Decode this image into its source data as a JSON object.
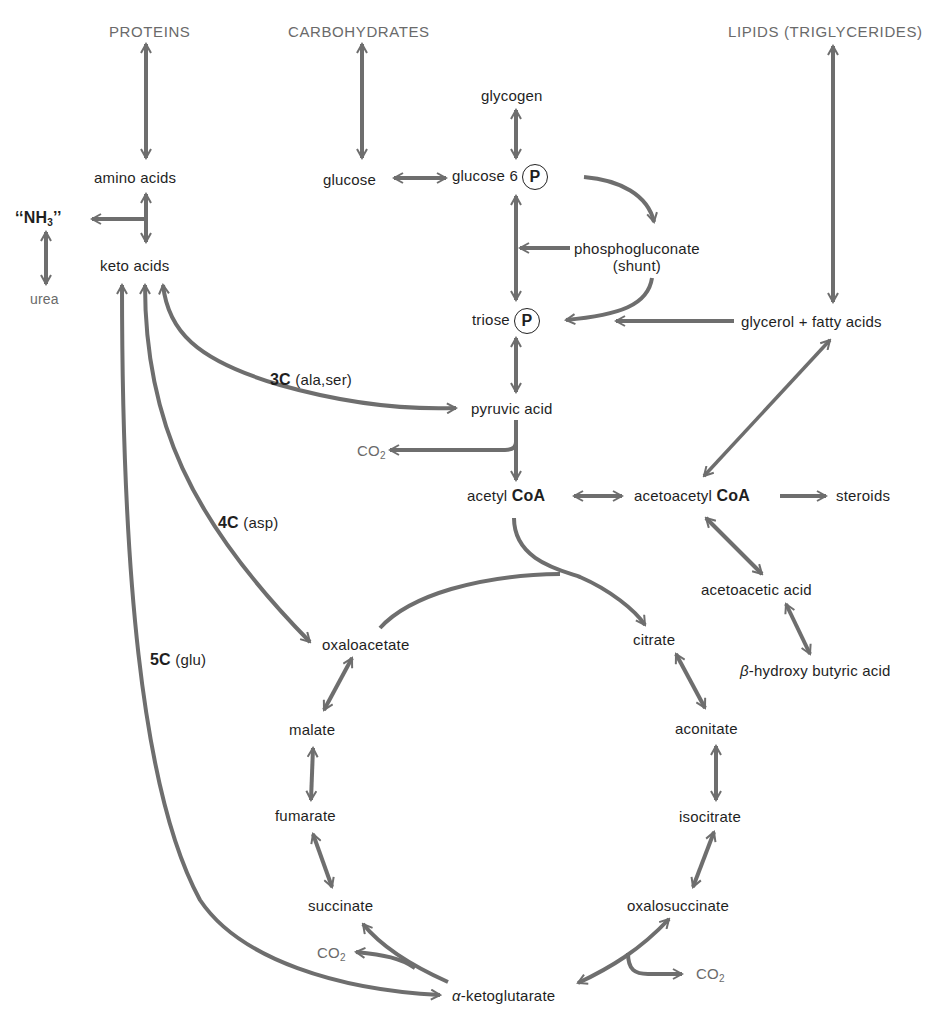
{
  "categories": {
    "proteins": "PROTEINS",
    "carbohydrates": "CARBOHYDRATES",
    "lipids": "LIPIDS (TRIGLYCERIDES)"
  },
  "nodes": {
    "amino_acids": "amino acids",
    "nh3_quote_open": "‘‘",
    "nh3_n": "NH",
    "nh3_sub": "3",
    "nh3_quote_close": "’’",
    "urea": "urea",
    "keto_acids": "keto acids",
    "glycogen": "glycogen",
    "glucose": "glucose",
    "glucose6": "glucose 6",
    "phospho_symbol": "P",
    "phosphogluconate": "phosphogluconate",
    "shunt": "(shunt)",
    "triose": "triose",
    "glycerol_fatty": "glycerol + fatty acids",
    "pyruvic_acid": "pyruvic acid",
    "co2": "CO",
    "co2_sub": "2",
    "acetyl": "acetyl",
    "coa": "CoA",
    "acetoacetyl": "acetoacetyl",
    "steroids": "steroids",
    "acetoacetic_acid": "acetoacetic acid",
    "beta_prefix": "β",
    "beta_rest": "-hydroxy butyric acid",
    "oxaloacetate": "oxaloacetate",
    "citrate": "citrate",
    "malate": "malate",
    "aconitate": "aconitate",
    "fumarate": "fumarate",
    "isocitrate": "isocitrate",
    "succinate": "succinate",
    "oxalosuccinate": "oxalosuccinate",
    "alpha_prefix": "α",
    "alpha_rest": "-ketoglutarate"
  },
  "pathway_labels": {
    "c3_bold": "3C",
    "c3_detail": "(ala,ser)",
    "c4_bold": "4C",
    "c4_detail": "(asp)",
    "c5_bold": "5C",
    "c5_detail": "(glu)"
  },
  "colors": {
    "arrow": "#6e6e6e",
    "text": "#1f1f1f",
    "category_text": "#6a6a6a",
    "background": "#ffffff"
  }
}
